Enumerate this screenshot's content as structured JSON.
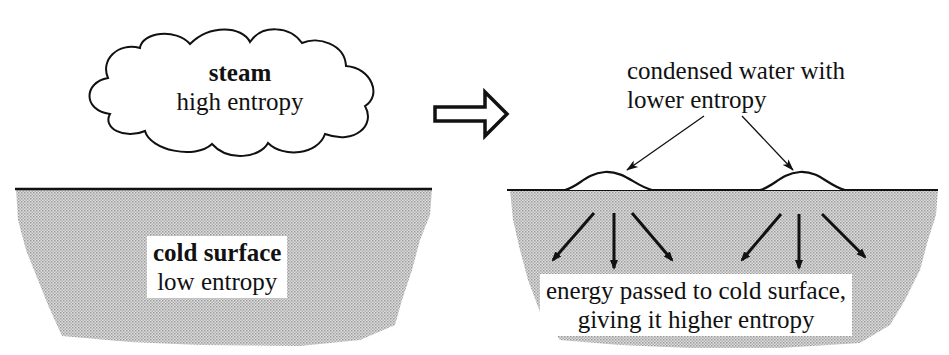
{
  "diagram": {
    "type": "before-after process diagram",
    "colors": {
      "ink": "#111111",
      "surface_fill": "#c8c8c8",
      "background": "#ffffff"
    },
    "before": {
      "cloud": {
        "title": "steam",
        "subtitle": "high entropy"
      },
      "surface": {
        "title": "cold surface",
        "subtitle": "low entropy"
      }
    },
    "transition_arrow": {
      "icon": "hollow-right-arrow-icon"
    },
    "after": {
      "callout": {
        "line1": "condensed water with",
        "line2": "lower entropy"
      },
      "droplets_count": 2,
      "energy_arrows_count": 6,
      "caption": {
        "line1": "energy passed to cold surface,",
        "line2": "giving it higher entropy"
      }
    }
  }
}
